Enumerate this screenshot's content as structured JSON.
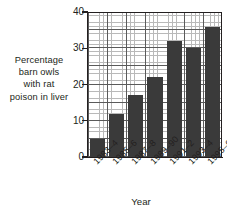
{
  "chart_data": {
    "type": "bar",
    "title": "",
    "xlabel": "Year",
    "ylabel": "Percentage barn owls with rat poison in liver",
    "ylabel_lines": [
      "Percentage",
      "barn owls",
      "with rat",
      "poison in liver"
    ],
    "categories": [
      "1983–4",
      "1985–6",
      "1987–8",
      "1989–90",
      "1991–2",
      "1993–4",
      "1995–6"
    ],
    "values": [
      5,
      12,
      17,
      22,
      32,
      30,
      36
    ],
    "yticks": [
      0,
      10,
      20,
      30,
      40
    ],
    "ylim": [
      0,
      40
    ],
    "grid": true,
    "grid_minor_step": 1,
    "grid_major_step": 5,
    "legend": "none",
    "bar_color": "#3a3a3a",
    "axis_color": "#231f20",
    "grid_major_color": "#5a5a5a",
    "grid_minor_color": "#b9b9b9"
  }
}
